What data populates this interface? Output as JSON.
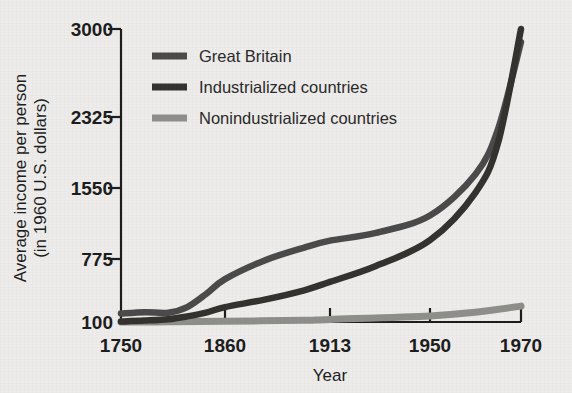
{
  "chart_data": {
    "type": "line",
    "title": "",
    "xlabel": "Year",
    "ylabel": "Average income per person (in 1960 U.S. dollars)",
    "ylabel_line1": "Average income per person",
    "ylabel_line2": "(in 1960 U.S. dollars)",
    "x_tick_labels": [
      "1750",
      "1860",
      "1913",
      "1950",
      "1970"
    ],
    "x_tick_values": [
      1750,
      1860,
      1913,
      1950,
      1970
    ],
    "y_tick_labels": [
      "100",
      "775",
      "1550",
      "2325",
      "3000"
    ],
    "y_tick_values": [
      100,
      775,
      1550,
      2325,
      3000
    ],
    "ylim": [
      100,
      3000
    ],
    "grid": false,
    "legend_position": "top-left-inside",
    "series": [
      {
        "name": "Great Britain",
        "color": "#4a4a4a",
        "x": [
          1750,
          1775,
          1800,
          1820,
          1840,
          1860,
          1880,
          1900,
          1913,
          1930,
          1950,
          1960,
          1965,
          1970
        ],
        "values": [
          190,
          205,
          200,
          260,
          400,
          560,
          760,
          900,
          975,
          1060,
          1250,
          1700,
          2200,
          2900
        ]
      },
      {
        "name": "Industrialized countries",
        "color": "#33322f",
        "x": [
          1750,
          1775,
          1800,
          1820,
          1840,
          1860,
          1880,
          1900,
          1913,
          1930,
          1950,
          1960,
          1965,
          1970
        ],
        "values": [
          105,
          115,
          130,
          160,
          200,
          260,
          340,
          440,
          530,
          700,
          980,
          1500,
          2050,
          3000
        ]
      },
      {
        "name": "Nonindustrialized countries",
        "color": "#8d8d8a",
        "x": [
          1750,
          1800,
          1860,
          1900,
          1913,
          1950,
          1960,
          1970
        ],
        "values": [
          100,
          102,
          108,
          118,
          128,
          165,
          205,
          270
        ]
      }
    ]
  },
  "legend": {
    "items": [
      {
        "label": "Great Britain",
        "color": "#4a4a4a"
      },
      {
        "label": "Industrialized countries",
        "color": "#33322f"
      },
      {
        "label": "Nonindustrialized countries",
        "color": "#8d8d8a"
      }
    ]
  }
}
